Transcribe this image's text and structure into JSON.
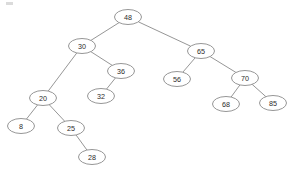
{
  "figure": {
    "kind": "binary-search-tree-diagram",
    "background_color": "#ffffff",
    "stroke_color": "#8a8a8a",
    "text_color": "#2b2b2b",
    "node_fill": "#ffffff"
  },
  "chart_data": {
    "type": "diagram",
    "title": "",
    "xlabel": "",
    "ylabel": "",
    "nodes": [
      {
        "id": "n48",
        "label": "48",
        "cx": 128,
        "cy": 17,
        "rx": 13.5,
        "ry": 7.5,
        "depth": 0
      },
      {
        "id": "n30",
        "label": "30",
        "cx": 82,
        "cy": 46,
        "rx": 13.5,
        "ry": 7.5,
        "depth": 1
      },
      {
        "id": "n65",
        "label": "65",
        "cx": 201,
        "cy": 51,
        "rx": 13.5,
        "ry": 7.5,
        "depth": 1
      },
      {
        "id": "n20",
        "label": "20",
        "cx": 43,
        "cy": 98,
        "rx": 13.5,
        "ry": 7.5,
        "depth": 2
      },
      {
        "id": "n36",
        "label": "36",
        "cx": 121,
        "cy": 71,
        "rx": 13.5,
        "ry": 7.5,
        "depth": 2
      },
      {
        "id": "n56",
        "label": "56",
        "cx": 177,
        "cy": 79,
        "rx": 13.5,
        "ry": 7.5,
        "depth": 2
      },
      {
        "id": "n70",
        "label": "70",
        "cx": 245,
        "cy": 78,
        "rx": 13.5,
        "ry": 7.5,
        "depth": 2
      },
      {
        "id": "n8",
        "label": "8",
        "cx": 21,
        "cy": 126,
        "rx": 13.5,
        "ry": 7.5,
        "depth": 3
      },
      {
        "id": "n25",
        "label": "25",
        "cx": 71,
        "cy": 128,
        "rx": 13.5,
        "ry": 7.5,
        "depth": 3
      },
      {
        "id": "n32",
        "label": "32",
        "cx": 101,
        "cy": 96,
        "rx": 13.5,
        "ry": 7.5,
        "depth": 3
      },
      {
        "id": "n68",
        "label": "68",
        "cx": 226,
        "cy": 104,
        "rx": 13.5,
        "ry": 7.5,
        "depth": 3
      },
      {
        "id": "n85",
        "label": "85",
        "cx": 273,
        "cy": 103,
        "rx": 13.5,
        "ry": 7.5,
        "depth": 3
      },
      {
        "id": "n28",
        "label": "28",
        "cx": 92,
        "cy": 157,
        "rx": 13.5,
        "ry": 7.5,
        "depth": 4
      }
    ],
    "edges": [
      {
        "from": "n48",
        "to": "n30",
        "side": "left"
      },
      {
        "from": "n48",
        "to": "n65",
        "side": "right"
      },
      {
        "from": "n30",
        "to": "n20",
        "side": "left"
      },
      {
        "from": "n30",
        "to": "n36",
        "side": "right"
      },
      {
        "from": "n20",
        "to": "n8",
        "side": "left"
      },
      {
        "from": "n20",
        "to": "n25",
        "side": "right"
      },
      {
        "from": "n25",
        "to": "n28",
        "side": "right"
      },
      {
        "from": "n36",
        "to": "n32",
        "side": "left"
      },
      {
        "from": "n65",
        "to": "n56",
        "side": "left"
      },
      {
        "from": "n65",
        "to": "n70",
        "side": "right"
      },
      {
        "from": "n70",
        "to": "n68",
        "side": "left"
      },
      {
        "from": "n70",
        "to": "n85",
        "side": "right"
      }
    ]
  }
}
